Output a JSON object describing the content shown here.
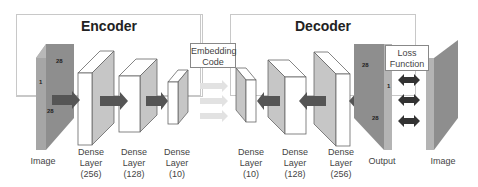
{
  "encoder": {
    "title": "Encoder",
    "input_label": "Image",
    "input_dims": {
      "top": "28",
      "left": "1",
      "bottom": "28"
    },
    "layers": [
      {
        "line1": "Dense",
        "line2": "Layer",
        "line3": "(256)"
      },
      {
        "line1": "Dense",
        "line2": "Layer",
        "line3": "(128)"
      },
      {
        "line1": "Dense",
        "line2": "Layer",
        "line3": "(10)"
      }
    ]
  },
  "embedding": {
    "line1": "Embedding",
    "line2": "Code"
  },
  "decoder": {
    "title": "Decoder",
    "layers": [
      {
        "line1": "Dense",
        "line2": "Layer",
        "line3": "(10)"
      },
      {
        "line1": "Dense",
        "line2": "Layer",
        "line3": "(128)"
      },
      {
        "line1": "Dense",
        "line2": "Layer",
        "line3": "(256)"
      }
    ],
    "output_label": "Output",
    "output_dims": {
      "top": "28",
      "left": "1",
      "bottom": "28"
    }
  },
  "loss": {
    "line1": "Loss",
    "line2": "Function"
  },
  "target_label": "Image",
  "colors": {
    "image_dark": "#8a8a8a",
    "image_light": "#a8a8a8",
    "layer_face": "#ffffff",
    "layer_side": "#c6c6c6",
    "arrow": "#555555",
    "faded_arrow": "#e4e4e4",
    "double_arrow": "#333333",
    "border": "#c8c8c8"
  }
}
